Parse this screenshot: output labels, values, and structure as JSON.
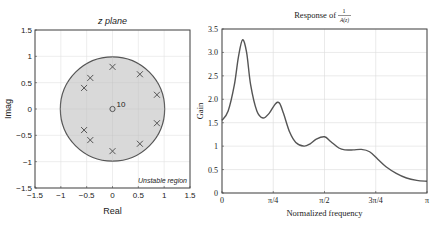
{
  "chart_data": [
    {
      "type": "scatter",
      "title": "z plane",
      "xlabel": "Real",
      "ylabel": "Imag",
      "xlim": [
        -1.5,
        1.5
      ],
      "ylim": [
        -1.5,
        1.5
      ],
      "xticks": [
        "−1.5",
        "−1",
        "−0.5",
        "0",
        "0.5",
        "1",
        "1.5"
      ],
      "yticks": [
        "1.5",
        "1",
        "0.5",
        "0",
        "−0.5",
        "−1",
        "−1.5"
      ],
      "grid": true,
      "unit_circle": {
        "radius": 1,
        "fill": "#d9d9d9",
        "stroke": "#555555"
      },
      "annotation": "Unstable region",
      "zero_annotation": "10",
      "zeros": [
        {
          "x": 0,
          "y": 0,
          "multiplicity": 10
        }
      ],
      "poles": [
        {
          "x": 0,
          "y": 0.8
        },
        {
          "x": 0,
          "y": -0.8
        },
        {
          "x": 0.53,
          "y": 0.66
        },
        {
          "x": 0.53,
          "y": -0.66
        },
        {
          "x": 0.86,
          "y": 0.27
        },
        {
          "x": 0.86,
          "y": -0.27
        },
        {
          "x": -0.43,
          "y": 0.59
        },
        {
          "x": -0.43,
          "y": -0.59
        },
        {
          "x": -0.55,
          "y": 0.4
        },
        {
          "x": -0.55,
          "y": -0.4
        }
      ]
    },
    {
      "type": "line",
      "title": "Response of",
      "title_fraction": {
        "numerator": "1",
        "denominator": "A(z)"
      },
      "xlabel": "Normalized frequency",
      "ylabel": "Gain",
      "xlim": [
        0,
        3.1416
      ],
      "ylim": [
        0,
        3.5
      ],
      "xticks": [
        "0",
        "π/4",
        "π/2",
        "3π/4",
        "π"
      ],
      "yticks": [
        "3.5",
        "3.0",
        "2.5",
        "2.0",
        "1.5",
        "1",
        "0.5",
        "0"
      ],
      "grid": true,
      "series": [
        {
          "name": "Gain",
          "x_frac_of_pi": [
            0,
            0.03,
            0.06,
            0.08,
            0.1,
            0.12,
            0.14,
            0.17,
            0.2,
            0.23,
            0.26,
            0.28,
            0.3,
            0.33,
            0.36,
            0.4,
            0.43,
            0.46,
            0.5,
            0.53,
            0.57,
            0.6,
            0.64,
            0.68,
            0.72,
            0.76,
            0.8,
            0.85,
            0.9,
            0.95,
            1.0
          ],
          "values": [
            1.55,
            1.75,
            2.3,
            2.9,
            3.27,
            3.0,
            2.3,
            1.75,
            1.6,
            1.7,
            1.9,
            1.92,
            1.7,
            1.3,
            1.08,
            1.0,
            1.05,
            1.15,
            1.2,
            1.1,
            0.96,
            0.92,
            0.92,
            0.93,
            0.88,
            0.72,
            0.56,
            0.42,
            0.32,
            0.27,
            0.25
          ]
        }
      ]
    }
  ],
  "left_plot": {
    "title": "z plane",
    "xlabel": "Real",
    "ylabel": "Imag",
    "annotation": "Unstable region",
    "zero_label": "10"
  },
  "right_plot": {
    "title_prefix": "Response of",
    "title_num": "1",
    "title_den": "A(z)",
    "xlabel": "Normalized frequency",
    "ylabel": "Gain"
  }
}
